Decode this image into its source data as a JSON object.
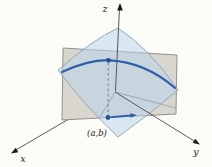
{
  "figure": {
    "background": "#fbfbf8",
    "labels": {
      "z_axis": "z",
      "x_axis": "x",
      "y_axis": "y",
      "point": "(a,b)"
    },
    "colors": {
      "surface_fill": "#b8d4ee",
      "surface_edge": "#8a97a5",
      "plane_fill": "#d9d6d0",
      "plane_edge": "#7d7b76",
      "trace_curve": "#2f5fa8",
      "point_fill": "#24508f",
      "axis_line": "#4a4a4a",
      "arrowhead": "#1a1a1a",
      "dashed_line": "#76828e",
      "label_color": "#1c1c1c"
    }
  }
}
